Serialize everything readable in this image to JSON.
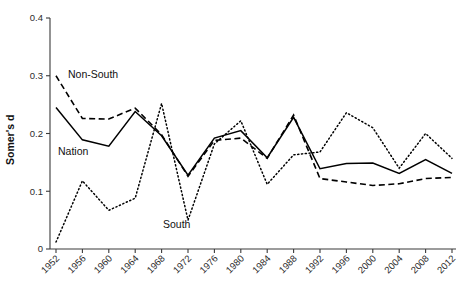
{
  "chart_data": {
    "type": "line",
    "title": "",
    "xlabel": "",
    "ylabel": "Somer's d",
    "ylim": [
      0,
      0.4
    ],
    "yticks": [
      0,
      0.1,
      0.2,
      0.3,
      0.4
    ],
    "ytick_labels": [
      "0",
      "0.1",
      "0.2",
      "0.3",
      "0.4"
    ],
    "grid": false,
    "legend": "inline-annotations",
    "categories": [
      1952,
      1956,
      1960,
      1964,
      1968,
      1972,
      1976,
      1980,
      1984,
      1988,
      1992,
      1996,
      2000,
      2004,
      2008,
      2012
    ],
    "xtick_labels": [
      "1952",
      "1956",
      "1960",
      "1964",
      "1968",
      "1972",
      "1976",
      "1980",
      "1984",
      "1988",
      "1992",
      "1996",
      "2000",
      "2004",
      "2008",
      "2012"
    ],
    "series": [
      {
        "name": "Nation",
        "style": "solid",
        "color": "#000000",
        "values": [
          0.245,
          0.189,
          0.178,
          0.238,
          0.196,
          0.128,
          0.192,
          0.205,
          0.158,
          0.228,
          0.139,
          0.148,
          0.149,
          0.131,
          0.155,
          0.131
        ]
      },
      {
        "name": "Non-South",
        "style": "dashed",
        "color": "#000000",
        "values": [
          0.3,
          0.226,
          0.225,
          0.244,
          0.198,
          0.126,
          0.188,
          0.192,
          0.157,
          0.232,
          0.122,
          0.116,
          0.11,
          0.113,
          0.122,
          0.124
        ]
      },
      {
        "name": "South",
        "style": "dotted",
        "color": "#000000",
        "values": [
          0.012,
          0.118,
          0.067,
          0.088,
          0.252,
          0.05,
          0.182,
          0.222,
          0.112,
          0.163,
          0.168,
          0.236,
          0.21,
          0.14,
          0.2,
          0.157
        ]
      }
    ],
    "annotations": [
      {
        "text": "Non-South",
        "series": "Non-South",
        "x_px": 68,
        "y_px": 78
      },
      {
        "text": "Nation",
        "series": "Nation",
        "x_px": 58,
        "y_px": 155
      },
      {
        "text": "South",
        "series": "South",
        "x_px": 163,
        "y_px": 228
      }
    ]
  },
  "axes": {
    "y_title": "Somer's d"
  }
}
